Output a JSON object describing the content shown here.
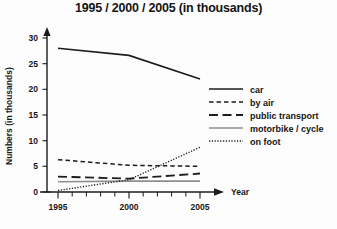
{
  "chart_data": {
    "type": "line",
    "title": "1995 / 2000 / 2005 (in thousands)",
    "xlabel": "Year",
    "ylabel": "Numbers (in thousands)",
    "x": [
      1995,
      2000,
      2005
    ],
    "x_tick_labels": [
      "1995",
      "2000",
      "2005"
    ],
    "y_tick_labels": [
      "0",
      "5",
      "10",
      "15",
      "20",
      "25",
      "30"
    ],
    "y_ticks": [
      0,
      5,
      10,
      15,
      20,
      25,
      30
    ],
    "ylim": [
      0,
      31
    ],
    "xlim": [
      1995,
      2006
    ],
    "grid": false,
    "legend_position": "right",
    "series": [
      {
        "name": "car",
        "values": [
          28.0,
          26.6,
          22.0
        ],
        "style": "solid",
        "color": "#1d1d1d"
      },
      {
        "name": "by air",
        "values": [
          6.3,
          5.2,
          5.0
        ],
        "style": "dashed",
        "color": "#1d1d1d"
      },
      {
        "name": "public transport",
        "values": [
          3.0,
          2.6,
          3.6
        ],
        "style": "long-dashed",
        "color": "#1d1d1d"
      },
      {
        "name": "motorbike / cycle",
        "values": [
          2.0,
          2.1,
          2.1
        ],
        "style": "solid-gray",
        "color": "#8e8e8e"
      },
      {
        "name": "on foot",
        "values": [
          0.3,
          2.4,
          8.7
        ],
        "style": "dotted",
        "color": "#1d1d1d"
      }
    ]
  },
  "axes": {
    "x_axis_label": "Year",
    "y_axis_label": "Numbers (in thousands)"
  },
  "legend": {
    "items": [
      {
        "label": "car"
      },
      {
        "label": "by air"
      },
      {
        "label": "public transport"
      },
      {
        "label": "motorbike / cycle"
      },
      {
        "label": "on foot"
      }
    ]
  }
}
